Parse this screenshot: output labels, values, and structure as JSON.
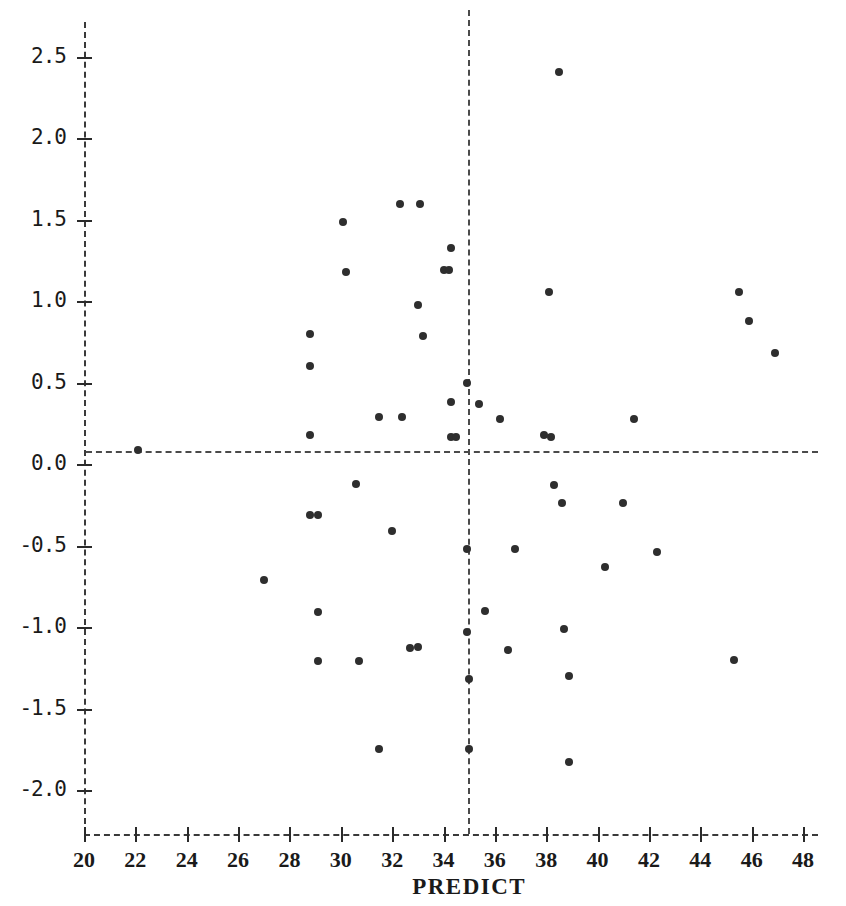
{
  "chart_data": {
    "type": "scatter",
    "title": "",
    "xlabel": "PREDICT",
    "ylabel": "",
    "xlim": [
      20,
      48
    ],
    "ylim": [
      -2.2,
      2.6
    ],
    "grid": false,
    "legend": null,
    "xticks": [
      20,
      22,
      24,
      26,
      28,
      30,
      32,
      34,
      36,
      38,
      40,
      42,
      44,
      46,
      48
    ],
    "xtick_labels": [
      "20",
      "22",
      "24",
      "26",
      "28",
      "30",
      "32",
      "34",
      "36",
      "38",
      "40",
      "42",
      "44",
      "46",
      "48"
    ],
    "yticks": [
      2.5,
      2.0,
      1.5,
      1.0,
      0.5,
      0.0,
      -0.5,
      -1.0,
      -1.5,
      -2.0
    ],
    "ytick_labels": [
      "2.5",
      "2.0",
      "1.5",
      "1.0",
      "0.5",
      "0.0",
      "-0.5",
      "-1.0",
      "-1.5",
      "-2.0"
    ],
    "reference_lines": [
      {
        "orientation": "horizontal",
        "value": 0.0,
        "style": "dashed"
      },
      {
        "orientation": "vertical",
        "value": 35.0,
        "style": "dashed"
      }
    ],
    "marker": {
      "shape": "circle",
      "color": "#2e2e2e",
      "size": 8
    },
    "n_points": 68,
    "points": [
      {
        "x": 22.1,
        "y": 0.09
      },
      {
        "x": 27.0,
        "y": -0.71
      },
      {
        "x": 28.8,
        "y": 0.8
      },
      {
        "x": 28.8,
        "y": 0.6
      },
      {
        "x": 28.8,
        "y": 0.18
      },
      {
        "x": 28.8,
        "y": -0.31
      },
      {
        "x": 29.1,
        "y": -0.31
      },
      {
        "x": 29.1,
        "y": -0.91
      },
      {
        "x": 29.1,
        "y": -1.21
      },
      {
        "x": 30.1,
        "y": 1.49
      },
      {
        "x": 30.2,
        "y": 1.18
      },
      {
        "x": 30.6,
        "y": -0.12
      },
      {
        "x": 30.7,
        "y": -1.21
      },
      {
        "x": 31.5,
        "y": 0.29
      },
      {
        "x": 31.5,
        "y": -1.75
      },
      {
        "x": 32.0,
        "y": -0.41
      },
      {
        "x": 32.3,
        "y": 1.6
      },
      {
        "x": 32.4,
        "y": 0.29
      },
      {
        "x": 32.7,
        "y": -1.13
      },
      {
        "x": 33.0,
        "y": 0.98
      },
      {
        "x": 33.0,
        "y": -1.12
      },
      {
        "x": 33.1,
        "y": 1.6
      },
      {
        "x": 33.2,
        "y": 0.79
      },
      {
        "x": 34.0,
        "y": 1.19
      },
      {
        "x": 34.2,
        "y": 1.19
      },
      {
        "x": 34.3,
        "y": 1.33
      },
      {
        "x": 34.3,
        "y": 0.38
      },
      {
        "x": 34.3,
        "y": 0.17
      },
      {
        "x": 34.5,
        "y": 0.17
      },
      {
        "x": 34.9,
        "y": 0.5
      },
      {
        "x": 34.9,
        "y": -0.52
      },
      {
        "x": 34.9,
        "y": -1.03
      },
      {
        "x": 35.0,
        "y": -1.32
      },
      {
        "x": 35.0,
        "y": -1.75
      },
      {
        "x": 35.4,
        "y": 0.37
      },
      {
        "x": 35.6,
        "y": -0.9
      },
      {
        "x": 36.2,
        "y": 0.28
      },
      {
        "x": 36.5,
        "y": -1.14
      },
      {
        "x": 36.8,
        "y": -0.52
      },
      {
        "x": 37.9,
        "y": 0.18
      },
      {
        "x": 38.1,
        "y": 1.06
      },
      {
        "x": 38.2,
        "y": 0.17
      },
      {
        "x": 38.3,
        "y": -0.13
      },
      {
        "x": 38.5,
        "y": 2.41
      },
      {
        "x": 38.6,
        "y": -0.24
      },
      {
        "x": 38.7,
        "y": -1.01
      },
      {
        "x": 38.9,
        "y": -1.3
      },
      {
        "x": 38.9,
        "y": -1.83
      },
      {
        "x": 40.3,
        "y": -0.63
      },
      {
        "x": 41.0,
        "y": -0.24
      },
      {
        "x": 41.4,
        "y": 0.28
      },
      {
        "x": 42.3,
        "y": -0.54
      },
      {
        "x": 45.3,
        "y": -1.2
      },
      {
        "x": 45.5,
        "y": 1.06
      },
      {
        "x": 45.9,
        "y": 0.88
      },
      {
        "x": 46.9,
        "y": 0.68
      }
    ]
  }
}
